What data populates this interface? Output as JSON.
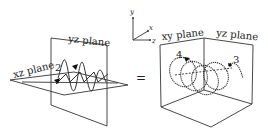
{
  "figure": {
    "left_panel": {
      "yz_plane_label": "yz plane",
      "xz_plane_label": "xz plane",
      "point_label": "2"
    },
    "equals_sign": "=",
    "axes": {
      "y": "y",
      "x": "x",
      "z": "z"
    },
    "right_panel": {
      "xy_plane_label": "xy plane",
      "yz_plane_label": "yz plane",
      "point_labels": [
        "4",
        "3"
      ]
    },
    "colors": {
      "line": "#333333",
      "background": "#ffffff"
    }
  }
}
